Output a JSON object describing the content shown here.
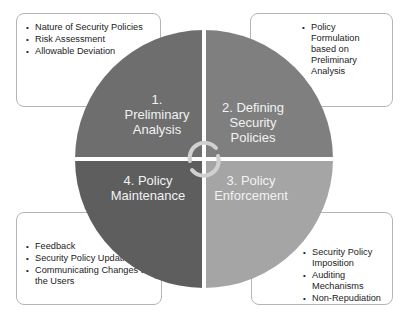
{
  "diagram": {
    "type": "cycle",
    "quadrants": [
      {
        "id": "q1",
        "position": "top-left",
        "label_lines": [
          "1.",
          "Preliminary",
          "Analysis"
        ],
        "color": "#6e6e6e"
      },
      {
        "id": "q2",
        "position": "top-right",
        "label_lines": [
          "2. Defining",
          "Security",
          "Policies"
        ],
        "color": "#7f7f7f"
      },
      {
        "id": "q3",
        "position": "bottom-right",
        "label_lines": [
          "3. Policy",
          "Enforcement"
        ],
        "color": "#a5a5a5"
      },
      {
        "id": "q4",
        "position": "bottom-left",
        "label_lines": [
          "4. Policy",
          "Maintenance"
        ],
        "color": "#5e5e5e"
      }
    ],
    "center_icon": "circular-arrows-icon",
    "arrow_color": "#d0d0d0"
  },
  "notes": {
    "top_left": {
      "items": [
        "Nature of Security Policies",
        "Risk Assessment",
        "Allowable Deviation"
      ]
    },
    "top_right": {
      "items": [
        "Policy Formulation based on Preliminary Analysis"
      ]
    },
    "bottom_left": {
      "items": [
        "Feedback",
        "Security Policy Updation",
        "Communicating Changes to the Users"
      ]
    },
    "bottom_right": {
      "items": [
        "Security Policy Imposition",
        "Auditing Mechanisms",
        "Non-Repudiation"
      ]
    },
    "bullet": "•"
  }
}
